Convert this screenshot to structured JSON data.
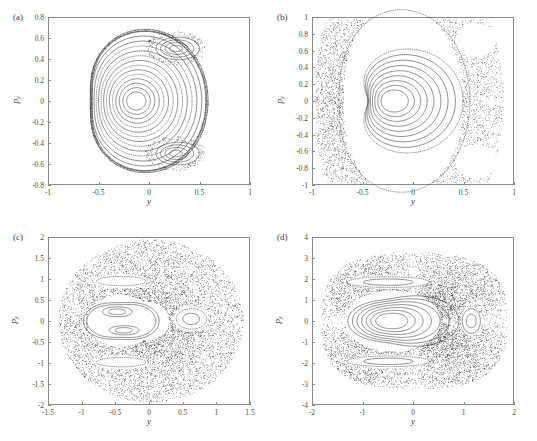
{
  "figure": {
    "type": "multi-panel-poincare-sections",
    "panel_count": 4
  },
  "chart_data": [
    {
      "type": "scatter",
      "panel": "(a)",
      "title": "",
      "xlabel": "y",
      "ylabel": "p_y",
      "xlim": [
        -1,
        1
      ],
      "ylim": [
        -0.8,
        0.8
      ],
      "xticks": [
        "-1",
        "-0.5",
        "0",
        "0.5",
        "1"
      ],
      "xtick_values": [
        -1,
        -0.5,
        0,
        0.5,
        1
      ],
      "yticks": [
        "-0.8",
        "-0.6",
        "-0.4",
        "-0.2",
        "0",
        "0.2",
        "0.4",
        "0.6",
        "0.8"
      ],
      "ytick_values": [
        -0.8,
        -0.6,
        -0.4,
        -0.2,
        0,
        0.2,
        0.4,
        0.6,
        0.8
      ],
      "grid": false,
      "legend": null,
      "description": "Nearly integrable Poincare section: nested KAM tori about a fixed point near (-0.13, 0), outer boundary torus, and two island chains at upper-right and lower-right",
      "center": [
        -0.13,
        0.0
      ],
      "outer_boundary_extent": [
        -0.52,
        0.66,
        -0.66,
        0.63
      ],
      "islands": [
        {
          "center": [
            0.26,
            0.5
          ],
          "rx": 0.2,
          "ry": 0.11
        },
        {
          "center": [
            0.26,
            -0.5
          ],
          "rx": 0.2,
          "ry": 0.11
        }
      ],
      "torus_count": 14,
      "chaotic_fraction": 0.04
    },
    {
      "type": "scatter",
      "panel": "(b)",
      "title": "",
      "xlabel": "y",
      "ylabel": "p_y",
      "xlim": [
        -1,
        1
      ],
      "ylim": [
        -1,
        1
      ],
      "xticks": [
        "-1",
        "-0.5",
        "0",
        "0.5",
        "1"
      ],
      "xtick_values": [
        -1,
        -0.5,
        0,
        0.5,
        1
      ],
      "yticks": [
        "-1",
        "-0.8",
        "-0.6",
        "-0.4",
        "-0.2",
        "0",
        "0.2",
        "0.4",
        "0.6",
        "0.8",
        "1"
      ],
      "ytick_values": [
        -1,
        -0.8,
        -0.6,
        -0.4,
        -0.2,
        0,
        0.2,
        0.4,
        0.6,
        0.8,
        1
      ],
      "grid": false,
      "legend": null,
      "description": "Mixed phase space: central regular island of triangular tori around (-0.2, 0) embedded in a chaotic sea filling the outer annulus",
      "center": [
        -0.2,
        0.0
      ],
      "outer_boundary_extent": [
        -0.78,
        0.92,
        -0.98,
        0.98
      ],
      "islands": [],
      "torus_count": 9,
      "chaotic_fraction": 0.45
    },
    {
      "type": "scatter",
      "panel": "(c)",
      "title": "",
      "xlabel": "y",
      "ylabel": "p_y",
      "xlim": [
        -1.5,
        1.5
      ],
      "ylim": [
        -2,
        2
      ],
      "xticks": [
        "-1.5",
        "-1",
        "-0.5",
        "0",
        "0.5",
        "1",
        "1.5"
      ],
      "xtick_values": [
        -1.5,
        -1,
        -0.5,
        0,
        0.5,
        1,
        1.5
      ],
      "yticks": [
        "-2",
        "-1.5",
        "-1",
        "-0.5",
        "0",
        "0.5",
        "1",
        "1.5",
        "2"
      ],
      "ytick_values": [
        -2,
        -1.5,
        -1,
        -0.5,
        0,
        0.5,
        1,
        1.5,
        2
      ],
      "grid": false,
      "legend": null,
      "description": "Strongly chaotic section: dominant chaotic sea with a central regular region containing two sub-islands, a separate island near (0.62, 0.05) and thin island chains near p_y = +/-0.95",
      "center": [
        -0.45,
        0.0
      ],
      "outer_boundary_extent": [
        -1.22,
        1.26,
        -1.72,
        1.7
      ],
      "islands": [
        {
          "center": [
            -0.48,
            0.22
          ],
          "rx": 0.2,
          "ry": 0.13
        },
        {
          "center": [
            -0.38,
            -0.22
          ],
          "rx": 0.2,
          "ry": 0.12
        },
        {
          "center": [
            0.62,
            0.05
          ],
          "rx": 0.22,
          "ry": 0.2
        },
        {
          "center": [
            -0.42,
            0.95
          ],
          "rx": 0.34,
          "ry": 0.13
        },
        {
          "center": [
            -0.42,
            -0.98
          ],
          "rx": 0.34,
          "ry": 0.13
        }
      ],
      "torus_count": 6,
      "chaotic_fraction": 0.7
    },
    {
      "type": "scatter",
      "panel": "(d)",
      "title": "",
      "xlabel": "y",
      "ylabel": "p_y",
      "xlim": [
        -2,
        2
      ],
      "ylim": [
        -4,
        4
      ],
      "xticks": [
        "-2",
        "-1",
        "0",
        "1",
        "2"
      ],
      "xtick_values": [
        -2,
        -1,
        0,
        1,
        2
      ],
      "yticks": [
        "-4",
        "-3",
        "-2",
        "-1",
        "0",
        "1",
        "2",
        "3",
        "4"
      ],
      "ytick_values": [
        -4,
        -3,
        -2,
        -1,
        0,
        1,
        2,
        3,
        4
      ],
      "grid": false,
      "legend": null,
      "description": "Largely chaotic section with a surviving regular core of nested tori around (-0.45, 0), a small island near (1.15, 0), and thin regular strips near p_y = +/-1.8",
      "center": [
        -0.45,
        0.0
      ],
      "outer_boundary_extent": [
        -1.75,
        1.82,
        -3.2,
        3.15
      ],
      "islands": [
        {
          "center": [
            1.15,
            0.0
          ],
          "rx": 0.18,
          "ry": 0.65
        },
        {
          "center": [
            -0.5,
            1.85
          ],
          "rx": 0.75,
          "ry": 0.3
        },
        {
          "center": [
            -0.5,
            -1.9
          ],
          "rx": 0.75,
          "ry": 0.3
        }
      ],
      "torus_count": 7,
      "chaotic_fraction": 0.65
    }
  ],
  "panels": [
    {
      "id": "a",
      "label": "(a)",
      "xlabel": "y",
      "ylabel": "p",
      "ylabel_sub": "y",
      "xticks": [
        "-1",
        "-0.5",
        "0",
        "0.5",
        "1"
      ],
      "yticks": [
        "0.8",
        "0.6",
        "0.4",
        "0.2",
        "0",
        "-0.2",
        "-0.4",
        "-0.6",
        "-0.8"
      ]
    },
    {
      "id": "b",
      "label": "(b)",
      "xlabel": "y",
      "ylabel": "p",
      "ylabel_sub": "y",
      "xticks": [
        "-1",
        "-0.5",
        "0",
        "0.5",
        "1"
      ],
      "yticks": [
        "1",
        "0.8",
        "0.6",
        "0.4",
        "0.2",
        "0",
        "-0.2",
        "-0.4",
        "-0.6",
        "-0.8",
        "-1"
      ]
    },
    {
      "id": "c",
      "label": "(c)",
      "xlabel": "y",
      "ylabel": "p",
      "ylabel_sub": "y",
      "xticks": [
        "-1.5",
        "-1",
        "-0.5",
        "0",
        "0.5",
        "1",
        "1.5"
      ],
      "yticks": [
        "2",
        "1.5",
        "1",
        "0.5",
        "0",
        "-0.5",
        "-1",
        "-1.5",
        "-2"
      ]
    },
    {
      "id": "d",
      "label": "(d)",
      "xlabel": "y",
      "ylabel": "p",
      "ylabel_sub": "y",
      "xticks": [
        "-2",
        "-1",
        "0",
        "1",
        "2"
      ],
      "yticks": [
        "4",
        "3",
        "2",
        "1",
        "0",
        "-1",
        "-2",
        "-3",
        "-4"
      ]
    }
  ],
  "colors": {
    "curve": "#2e2e2e",
    "axis": "#8a8a8a",
    "text": "#3a3a3a",
    "background": "#ffffff"
  }
}
